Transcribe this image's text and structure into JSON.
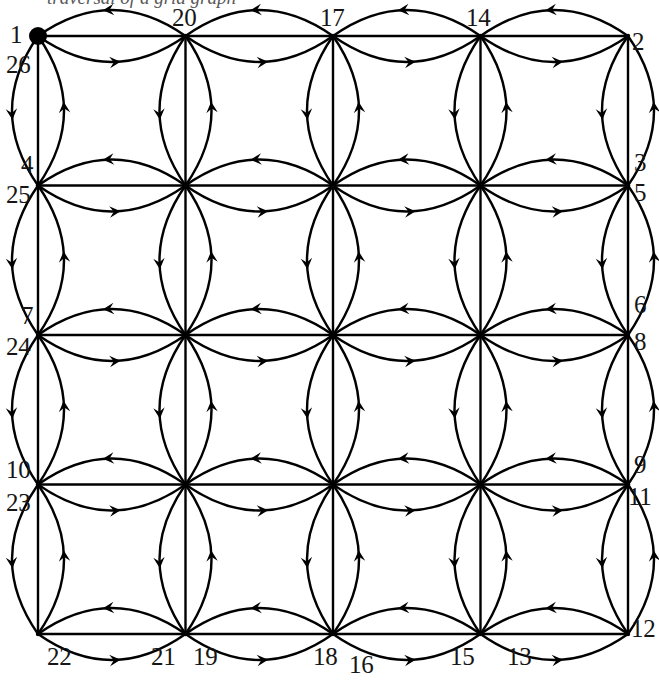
{
  "figure": {
    "type": "directed-graph-diagram",
    "caption_fragment": "traversal of a grid graph",
    "background_color": "#ffffff",
    "stroke_color": "#000000",
    "label_color": "#161616",
    "grid": {
      "columns": 5,
      "rows": 5,
      "cells_x": 4,
      "cells_y": 4,
      "x_start": 38,
      "y_start": 36,
      "x_step": 147.5,
      "y_step": 149.5,
      "edges_per_pair": 3,
      "arc_bow": 26,
      "line_width": 2.4,
      "arrow_size": 11
    },
    "start_marker": {
      "name": "start-node-dot",
      "x": 38,
      "y": 36,
      "radius": 9
    },
    "labels": [
      {
        "text": "1",
        "x": 10,
        "y": 22,
        "align": "left"
      },
      {
        "text": "26",
        "x": 6,
        "y": 52,
        "align": "left"
      },
      {
        "text": "20",
        "x": 172,
        "y": 5,
        "align": "left"
      },
      {
        "text": "17",
        "x": 320,
        "y": 5,
        "align": "left"
      },
      {
        "text": "14",
        "x": 466,
        "y": 5,
        "align": "left"
      },
      {
        "text": "2",
        "x": 632,
        "y": 29,
        "align": "left"
      },
      {
        "text": "4",
        "x": 21,
        "y": 152,
        "align": "left"
      },
      {
        "text": "25",
        "x": 6,
        "y": 182,
        "align": "left"
      },
      {
        "text": "3",
        "x": 634,
        "y": 150,
        "align": "left"
      },
      {
        "text": "5",
        "x": 634,
        "y": 180,
        "align": "left"
      },
      {
        "text": "7",
        "x": 21,
        "y": 303,
        "align": "left"
      },
      {
        "text": "24",
        "x": 6,
        "y": 334,
        "align": "left"
      },
      {
        "text": "6",
        "x": 634,
        "y": 292,
        "align": "left"
      },
      {
        "text": "8",
        "x": 634,
        "y": 329,
        "align": "left"
      },
      {
        "text": "10",
        "x": 6,
        "y": 457,
        "align": "left"
      },
      {
        "text": "23",
        "x": 6,
        "y": 490,
        "align": "left"
      },
      {
        "text": "9",
        "x": 634,
        "y": 452,
        "align": "left"
      },
      {
        "text": "11",
        "x": 628,
        "y": 484,
        "align": "left"
      },
      {
        "text": "22",
        "x": 47,
        "y": 644,
        "align": "left"
      },
      {
        "text": "21",
        "x": 151,
        "y": 644,
        "align": "left"
      },
      {
        "text": "19",
        "x": 193,
        "y": 644,
        "align": "left"
      },
      {
        "text": "18",
        "x": 313,
        "y": 644,
        "align": "left"
      },
      {
        "text": "16",
        "x": 349,
        "y": 652,
        "align": "left"
      },
      {
        "text": "15",
        "x": 450,
        "y": 644,
        "align": "left"
      },
      {
        "text": "13",
        "x": 507,
        "y": 644,
        "align": "left"
      },
      {
        "text": "12",
        "x": 631,
        "y": 616,
        "align": "left"
      }
    ]
  }
}
